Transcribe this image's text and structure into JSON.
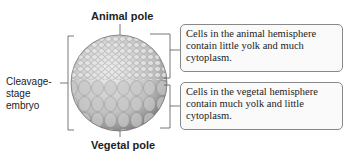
{
  "labels": {
    "animal_pole": "Animal pole",
    "vegetal_pole": "Vegetal pole",
    "embryo": [
      "Cleavage-",
      "stage",
      "embryo"
    ]
  },
  "callouts": {
    "animal": "Cells in the animal hemisphere contain little yolk and much cytoplasm.",
    "vegetal": "Cells in the vegetal hemisphere contain much yolk and little cytoplasm."
  }
}
